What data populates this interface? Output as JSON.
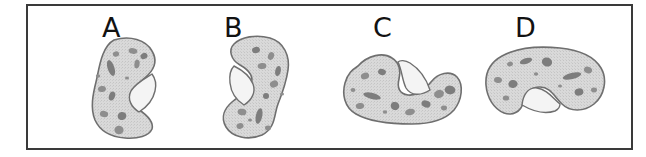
{
  "figure": {
    "kind": "hand-drawn-shape-comparison",
    "border_color": "#3a3a3a",
    "background_color": "#ffffff",
    "blob_fill_color": "#d6d6d6",
    "blob_outline_color": "#6f6f6f",
    "speckle_color": "#8e8e8e",
    "notch_fill_color": "#f4f4f4",
    "items": [
      {
        "label": "A",
        "label_x": 74,
        "label_y": 8,
        "orientation": "vertical",
        "notch_side": "right",
        "blob_x": 52,
        "blob_y": 28,
        "blob_w": 100,
        "blob_h": 108
      },
      {
        "label": "B",
        "label_x": 196,
        "label_y": 8,
        "orientation": "vertical",
        "notch_side": "left",
        "blob_x": 176,
        "blob_y": 28,
        "blob_w": 100,
        "blob_h": 108
      },
      {
        "label": "C",
        "label_x": 345,
        "label_y": 8,
        "orientation": "horizontal",
        "notch_side": "top",
        "blob_x": 310,
        "blob_y": 40,
        "blob_w": 128,
        "blob_h": 84
      },
      {
        "label": "D",
        "label_x": 487,
        "label_y": 8,
        "orientation": "horizontal",
        "notch_side": "bottom",
        "blob_x": 452,
        "blob_y": 36,
        "blob_w": 128,
        "blob_h": 84
      }
    ]
  }
}
